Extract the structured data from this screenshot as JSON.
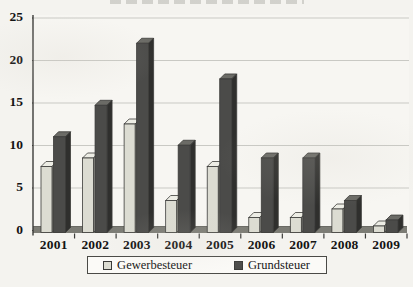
{
  "page": {
    "background": "#f4f3ef",
    "clipped_title_visible": "illegible clipped text sliver at top edge"
  },
  "chart_data": {
    "type": "bar",
    "style": "3d-columns",
    "title_note": "in v. H.",
    "categories": [
      "2001",
      "2002",
      "2003",
      "2004",
      "2005",
      "2006",
      "2007",
      "2008",
      "2009"
    ],
    "series": [
      {
        "name": "Gewerbesteuer",
        "color": "#dcdcd2",
        "color_top": "#edede5",
        "color_side": "#9c9c94",
        "values": [
          8,
          9,
          13,
          4,
          8,
          2,
          2,
          3,
          1
        ]
      },
      {
        "name": "Grundsteuer",
        "color": "#4b4b49",
        "color_top": "#6b6b66",
        "color_side": "#2f2f2d",
        "values": [
          11.5,
          15.2,
          22.5,
          10.5,
          18.3,
          9,
          9,
          4,
          1.7
        ]
      }
    ],
    "ylabel": "",
    "xlabel": "",
    "ylim": [
      0,
      25
    ],
    "yticks": [
      0,
      5,
      10,
      15,
      20,
      25
    ],
    "grid": true,
    "gridline_color": "#c9c9c4",
    "axis_color": "#3c3c3a",
    "floor_color": "#7c7c75",
    "plot_bg": "#f7f6f2",
    "legend_position": "bottom"
  }
}
